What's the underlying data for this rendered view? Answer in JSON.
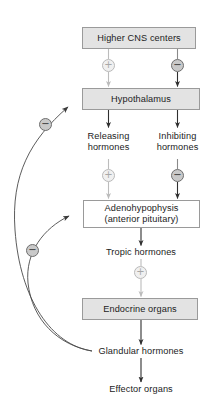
{
  "diagram": {
    "colors": {
      "box_fill_shaded": "#e3e3e3",
      "box_fill_plain": "#ffffff",
      "box_border": "#9a9a9a",
      "arrow_stimulatory": "#b9b9b9",
      "arrow_inhibitory": "#3a3a3a",
      "text": "#1c1c1c"
    },
    "nodes": [
      {
        "id": "higher-cns-centers",
        "label": "Higher CNS centers",
        "style": "shaded"
      },
      {
        "id": "hypothalamus",
        "label": "Hypothalamus",
        "style": "shaded"
      },
      {
        "id": "adenohypophysis",
        "label": "Adenohypophysis\n(anterior pituitary)",
        "style": "plain"
      },
      {
        "id": "endocrine-organs",
        "label": "Endocrine organs",
        "style": "shaded"
      }
    ],
    "labels": [
      {
        "id": "releasing-hormones",
        "text": "Releasing\nhormones"
      },
      {
        "id": "inhibiting-hormones",
        "text": "Inhibiting\nhormones"
      },
      {
        "id": "tropic-hormones",
        "text": "Tropic hormones"
      },
      {
        "id": "glandular-hormones",
        "text": "Glandular hormones"
      },
      {
        "id": "effector-organs",
        "text": "Effector organs"
      }
    ],
    "signs": [
      {
        "id": "cns-to-hypothalamus-stimulatory",
        "sign": "+",
        "glyph": "⊕"
      },
      {
        "id": "cns-to-hypothalamus-inhibitory",
        "sign": "−",
        "glyph": "⊖"
      },
      {
        "id": "releasing-to-adenohypophysis-stimulatory",
        "sign": "+",
        "glyph": "⊕"
      },
      {
        "id": "inhibiting-to-adenohypophysis-inhibitory",
        "sign": "−",
        "glyph": "⊖"
      },
      {
        "id": "tropic-to-endocrine-stimulatory",
        "sign": "+",
        "glyph": "⊕"
      },
      {
        "id": "feedback-to-hypothalamus-inhibitory",
        "sign": "−",
        "glyph": "⊖"
      },
      {
        "id": "feedback-to-adenohypophysis-inhibitory",
        "sign": "−",
        "glyph": "⊖"
      }
    ]
  }
}
